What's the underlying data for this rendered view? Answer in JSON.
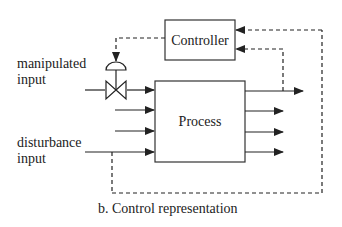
{
  "diagram": {
    "controller_label": "Controller",
    "process_label": "Process",
    "manipulated_input": {
      "line1": "manipulated",
      "line2": "input"
    },
    "disturbance_input": {
      "line1": "disturbance",
      "line2": "input"
    },
    "caption": "b. Control representation",
    "colors": {
      "line": "#222222",
      "background": "#ffffff"
    }
  }
}
